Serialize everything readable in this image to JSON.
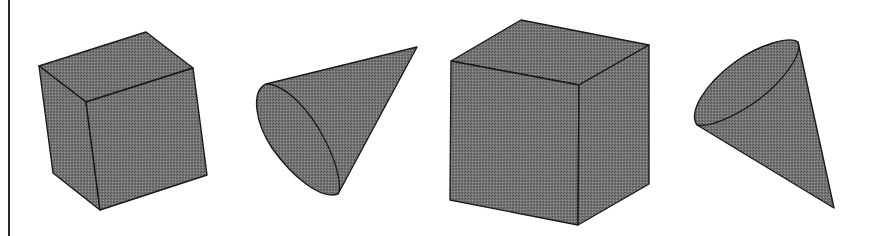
{
  "figure": {
    "colors": {
      "fill": "#6f6f6f",
      "fill_dark": "#5a5a5a",
      "fill_light": "#8a8a8a",
      "stroke": "#1a1a1a",
      "border": "#2a2a2a",
      "background": "#ffffff"
    },
    "shapes": [
      {
        "name": "cube-1",
        "type": "cube"
      },
      {
        "name": "cone-1",
        "type": "cone"
      },
      {
        "name": "cube-2",
        "type": "cube"
      },
      {
        "name": "cone-2",
        "type": "cone"
      }
    ]
  }
}
